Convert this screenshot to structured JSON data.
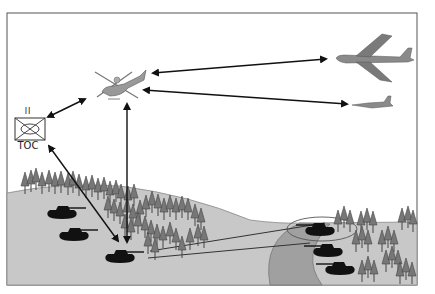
{
  "diagram": {
    "type": "battlefield-communications",
    "nodes": [
      {
        "id": "toc",
        "label": "TOC",
        "echelon": "II",
        "symbol": "unit-symbol-box"
      },
      {
        "id": "helicopter",
        "label": "",
        "symbol": "scout-helicopter"
      },
      {
        "id": "bomber",
        "label": "",
        "symbol": "heavy-bomber-aircraft"
      },
      {
        "id": "fighter",
        "label": "",
        "symbol": "fighter-aircraft"
      },
      {
        "id": "friendly-tanks",
        "label": "",
        "symbol": "tank-group-left",
        "count": 3
      },
      {
        "id": "enemy-tanks",
        "label": "",
        "symbol": "tank-group-right",
        "count": 3
      }
    ],
    "links": [
      {
        "from": "toc",
        "to": "helicopter",
        "bidirectional": true
      },
      {
        "from": "helicopter",
        "to": "bomber",
        "bidirectional": true
      },
      {
        "from": "helicopter",
        "to": "fighter",
        "bidirectional": true
      },
      {
        "from": "helicopter",
        "to": "friendly-tanks",
        "bidirectional": true
      },
      {
        "from": "toc",
        "to": "friendly-tanks",
        "bidirectional": true
      }
    ],
    "colors": {
      "frame": "#555555",
      "ground": "#c8c8c8",
      "river": "#a0a0a0",
      "tree": "#707070",
      "tank": "#111111",
      "arrow": "#111111",
      "aircraft": "#888888"
    }
  },
  "toc": {
    "label": "TOC",
    "echelon": "II"
  }
}
